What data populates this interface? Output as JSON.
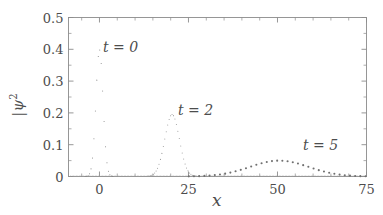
{
  "chart_data": {
    "type": "line",
    "title": "",
    "subtitle": "",
    "xlabel": "x",
    "ylabel": "|ψ|²",
    "xlim": [
      -8.7,
      75
    ],
    "ylim": [
      0,
      0.5
    ],
    "grid": false,
    "legend_position": "inline-annotations",
    "xticks": [
      0,
      25,
      50,
      75
    ],
    "xtick_labels": [
      "0",
      "25",
      "50",
      "75"
    ],
    "yticks": [
      0,
      0.1,
      0.2,
      0.3,
      0.4,
      0.5
    ],
    "ytick_labels": [
      "0",
      "0.1",
      "0.2",
      "0.3",
      "0.4",
      "0.5"
    ],
    "minor_xticks_per_interval": 5,
    "minor_yticks_per_interval": 2,
    "series": [
      {
        "name": "t = 0",
        "style": "dotted",
        "color": "#808080",
        "center": 0.0,
        "sigma": 1.0,
        "peak": 0.399,
        "annotation": "t = 0",
        "annotation_x": 8.5,
        "annotation_y": 0.435,
        "x": [
          -5.0,
          -4.5,
          -4.0,
          -3.5,
          -3.0,
          -2.75,
          -2.5,
          -2.25,
          -2.0,
          -1.75,
          -1.5,
          -1.25,
          -1.0,
          -0.75,
          -0.5,
          -0.25,
          0.0,
          0.25,
          0.5,
          0.75,
          1.0,
          1.25,
          1.5,
          1.75,
          2.0,
          2.25,
          2.5,
          2.75,
          3.0,
          3.5,
          4.0,
          4.5,
          5.0
        ],
        "y": [
          0.0,
          0.0,
          0.0,
          0.001,
          0.004,
          0.009,
          0.018,
          0.032,
          0.054,
          0.086,
          0.13,
          0.183,
          0.242,
          0.301,
          0.352,
          0.387,
          0.399,
          0.387,
          0.352,
          0.301,
          0.242,
          0.183,
          0.13,
          0.086,
          0.054,
          0.032,
          0.018,
          0.009,
          0.004,
          0.001,
          0.0,
          0.0,
          0.0
        ]
      },
      {
        "name": "t = 2",
        "style": "dotted",
        "color": "#969696",
        "center": 20.4,
        "sigma": 2.04,
        "peak": 0.195,
        "annotation": "t = 2",
        "annotation_x": 29.5,
        "annotation_y": 0.237,
        "x": [
          13.0,
          14.0,
          15.0,
          15.5,
          16.0,
          16.5,
          17.0,
          17.5,
          18.0,
          18.5,
          19.0,
          19.5,
          20.0,
          20.4,
          20.8,
          21.3,
          21.8,
          22.3,
          22.8,
          23.3,
          23.8,
          24.3,
          25.0,
          26.0,
          27.0,
          28.0
        ],
        "y": [
          0.001,
          0.003,
          0.01,
          0.017,
          0.028,
          0.043,
          0.063,
          0.087,
          0.113,
          0.139,
          0.162,
          0.18,
          0.192,
          0.195,
          0.192,
          0.182,
          0.166,
          0.144,
          0.119,
          0.094,
          0.07,
          0.049,
          0.028,
          0.01,
          0.003,
          0.001
        ]
      },
      {
        "name": "t = 5",
        "style": "dotted-thick",
        "color": "#707070",
        "center": 50.5,
        "sigma": 8.2,
        "peak": 0.05,
        "annotation": "t = 5",
        "annotation_x": 59.5,
        "annotation_y": 0.083,
        "x": [
          28.0,
          30.0,
          32.0,
          34.0,
          36.0,
          38.0,
          40.0,
          42.0,
          44.0,
          46.0,
          48.0,
          50.0,
          52.0,
          54.0,
          56.0,
          58.0,
          60.0,
          62.0,
          64.0,
          66.0,
          68.0,
          70.0,
          72.0,
          74.0
        ],
        "y": [
          0.001,
          0.002,
          0.004,
          0.007,
          0.011,
          0.017,
          0.024,
          0.032,
          0.04,
          0.046,
          0.049,
          0.05,
          0.049,
          0.046,
          0.04,
          0.033,
          0.026,
          0.019,
          0.013,
          0.009,
          0.005,
          0.003,
          0.002,
          0.001
        ]
      }
    ],
    "axis_color": "#8c8c8c",
    "text_color": "#4d4d4d",
    "background": "#ffffff"
  }
}
